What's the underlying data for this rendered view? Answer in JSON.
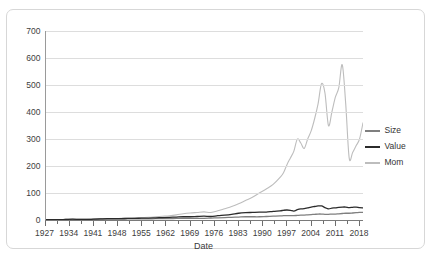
{
  "panel": {
    "clipped_top_text": ""
  },
  "axes": {
    "x_title": "Date",
    "y_title": "",
    "y_ticks": [
      0,
      100,
      200,
      300,
      400,
      500,
      600,
      700
    ],
    "x_ticks": [
      1927,
      1934,
      1941,
      1948,
      1955,
      1962,
      1969,
      1976,
      1983,
      1990,
      1997,
      2004,
      2011,
      2018
    ]
  },
  "legend": {
    "position": "right",
    "items": [
      {
        "label": "Size",
        "color": "#7f7f7f"
      },
      {
        "label": "Value",
        "color": "#2b2b2b"
      },
      {
        "label": "Mom",
        "color": "#bdbdbd"
      }
    ]
  },
  "chart_data": {
    "type": "line",
    "title": "",
    "xlabel": "Date",
    "ylabel": "",
    "xlim": [
      1927,
      2019
    ],
    "ylim": [
      0,
      700
    ],
    "grid": true,
    "legend_position": "right",
    "x": [
      1927,
      1929,
      1931,
      1933,
      1935,
      1937,
      1939,
      1941,
      1943,
      1945,
      1947,
      1949,
      1951,
      1953,
      1955,
      1957,
      1959,
      1961,
      1963,
      1965,
      1967,
      1969,
      1971,
      1973,
      1975,
      1977,
      1979,
      1981,
      1983,
      1985,
      1987,
      1989,
      1991,
      1993,
      1995,
      1996,
      1997,
      1998,
      1999,
      2000,
      2001,
      2002,
      2003,
      2004,
      2005,
      2006,
      2007,
      2008,
      2009,
      2010,
      2011,
      2012,
      2013,
      2014,
      2015,
      2016,
      2017,
      2018,
      2019
    ],
    "series": [
      {
        "name": "Size",
        "color": "#7f7f7f",
        "values": [
          1,
          1,
          1,
          2,
          2,
          2,
          2,
          2,
          3,
          3,
          3,
          3,
          4,
          4,
          4,
          4,
          5,
          5,
          5,
          6,
          6,
          6,
          6,
          6,
          7,
          8,
          9,
          10,
          11,
          12,
          12,
          12,
          13,
          14,
          15,
          16,
          16,
          16,
          16,
          17,
          18,
          18,
          19,
          20,
          21,
          22,
          22,
          21,
          21,
          22,
          22,
          23,
          24,
          25,
          25,
          26,
          27,
          28,
          28
        ]
      },
      {
        "name": "Value",
        "color": "#2b2b2b",
        "values": [
          1,
          1,
          1,
          2,
          3,
          2,
          2,
          3,
          4,
          5,
          5,
          5,
          6,
          6,
          7,
          7,
          8,
          9,
          10,
          11,
          12,
          12,
          13,
          14,
          13,
          16,
          18,
          21,
          25,
          27,
          28,
          29,
          29,
          32,
          34,
          36,
          37,
          36,
          33,
          38,
          41,
          42,
          45,
          48,
          50,
          52,
          52,
          46,
          41,
          44,
          45,
          47,
          48,
          48,
          46,
          47,
          48,
          46,
          45
        ]
      },
      {
        "name": "Mom",
        "color": "#bdbdbd",
        "values": [
          1,
          1,
          1,
          2,
          2,
          2,
          2,
          3,
          4,
          5,
          5,
          6,
          7,
          8,
          9,
          10,
          12,
          14,
          16,
          19,
          23,
          26,
          28,
          30,
          28,
          34,
          42,
          50,
          60,
          72,
          84,
          100,
          115,
          132,
          158,
          175,
          205,
          230,
          255,
          300,
          285,
          265,
          300,
          330,
          375,
          430,
          505,
          470,
          350,
          400,
          455,
          490,
          575,
          430,
          230,
          250,
          275,
          300,
          360
        ]
      }
    ]
  }
}
